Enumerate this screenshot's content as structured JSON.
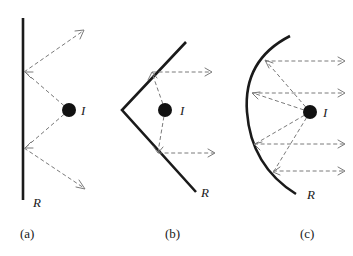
{
  "figure": {
    "background_color": "#ffffff",
    "mirror_color": "#1a1a1a",
    "ray_color": "#7a7a7a",
    "source_color": "#111111",
    "panels": [
      {
        "id": "a",
        "caption": "(a)",
        "mirror_shape": "flat-vertical-line",
        "mirror_label": "R",
        "source_label": "I",
        "source": {
          "x": 69,
          "y": 110,
          "r": 7
        },
        "mirror_points": [
          [
            23,
            18
          ],
          [
            23,
            200
          ]
        ],
        "rays": [
          {
            "from": [
              69,
              110
            ],
            "to": [
              23,
              72
            ],
            "arrow": true
          },
          {
            "from": [
              23,
              72
            ],
            "to": [
              85,
              30
            ],
            "arrow": true
          },
          {
            "from": [
              69,
              110
            ],
            "to": [
              23,
              148
            ],
            "arrow": true
          },
          {
            "from": [
              23,
              148
            ],
            "to": [
              85,
              188
            ],
            "arrow": true
          }
        ],
        "mirror_label_pos": {
          "x": 33,
          "y": 206
        },
        "caption_pos": {
          "x": 20,
          "y": 238
        },
        "source_label_pos": {
          "x": 81,
          "y": 115
        }
      },
      {
        "id": "b",
        "caption": "(b)",
        "mirror_shape": "v-shaped-open-right",
        "mirror_label": "R",
        "source_label": "I",
        "source": {
          "x": 165,
          "y": 110,
          "r": 7
        },
        "mirror_points": [
          [
            186,
            42
          ],
          [
            122,
            110
          ],
          [
            196,
            192
          ]
        ],
        "rays": [
          {
            "from": [
              165,
              110
            ],
            "to": [
              152,
              72
            ],
            "arrow": true
          },
          {
            "from": [
              152,
              72
            ],
            "to": [
              212,
              72
            ],
            "arrow": true
          },
          {
            "from": [
              165,
              110
            ],
            "to": [
              158,
              153
            ],
            "arrow": true
          },
          {
            "from": [
              158,
              153
            ],
            "to": [
              215,
              153
            ],
            "arrow": true
          }
        ],
        "mirror_label_pos": {
          "x": 200,
          "y": 196
        },
        "caption_pos": {
          "x": 165,
          "y": 238
        },
        "source_label_pos": {
          "x": 180,
          "y": 115
        }
      },
      {
        "id": "c",
        "caption": "(c)",
        "mirror_shape": "parabolic-open-right",
        "mirror_label": "R",
        "source_label": "I",
        "source": {
          "x": 310,
          "y": 112,
          "r": 7
        },
        "mirror_vertex": [
          247,
          112
        ],
        "mirror_top": [
          290,
          36
        ],
        "mirror_bottom": [
          295,
          194
        ],
        "rays": [
          {
            "from": [
              310,
              112
            ],
            "to": [
              264,
              61
            ],
            "arrow": true
          },
          {
            "from": [
              264,
              61
            ],
            "to": [
              345,
              61
            ],
            "arrow": true
          },
          {
            "from": [
              310,
              112
            ],
            "to": [
              251,
              93
            ],
            "arrow": true
          },
          {
            "from": [
              251,
              93
            ],
            "to": [
              345,
              93
            ],
            "arrow": true
          },
          {
            "from": [
              310,
              112
            ],
            "to": [
              253,
              144
            ],
            "arrow": true
          },
          {
            "from": [
              253,
              144
            ],
            "to": [
              345,
              144
            ],
            "arrow": true
          },
          {
            "from": [
              310,
              112
            ],
            "to": [
              272,
              171
            ],
            "arrow": true
          },
          {
            "from": [
              272,
              171
            ],
            "to": [
              345,
              171
            ],
            "arrow": true
          }
        ],
        "mirror_label_pos": {
          "x": 306,
          "y": 198
        },
        "caption_pos": {
          "x": 300,
          "y": 238
        },
        "source_label_pos": {
          "x": 323,
          "y": 117
        }
      }
    ]
  }
}
